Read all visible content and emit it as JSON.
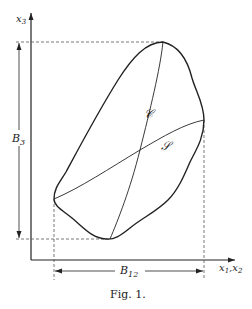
{
  "figure": {
    "caption": "Fig. 1.",
    "axes": {
      "vertical_label": "x",
      "vertical_subscript": "3",
      "horizontal_label_1": "x",
      "horizontal_sub_1": "1",
      "horizontal_sep": ",",
      "horizontal_label_2": "x",
      "horizontal_sub_2": "2"
    },
    "dimensions": {
      "vertical": {
        "label": "B",
        "subscript": "3"
      },
      "horizontal": {
        "label": "B",
        "subscript": "12"
      }
    },
    "curves": {
      "curve_c_label": "𝒞",
      "curve_s_label": "𝒮"
    }
  }
}
